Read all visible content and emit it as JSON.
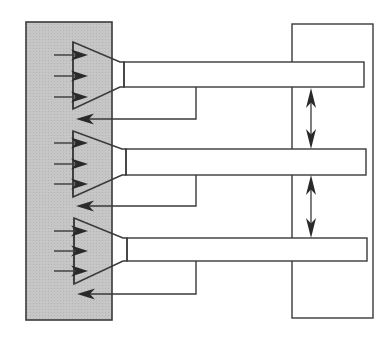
{
  "diagram": {
    "type": "schematic",
    "colors": {
      "stroke": "#3a3a3a",
      "arrow_fill": "#2a2a2a",
      "panel_fill": "#c4c4c4",
      "background": "#ffffff"
    },
    "left_panel": {
      "x": 26,
      "y": 22,
      "w": 86,
      "h": 298
    },
    "right_frame": {
      "x": 292,
      "y": 24,
      "w": 81,
      "h": 294
    },
    "units": [
      {
        "id": 1,
        "funnel": {
          "x_left": 73,
          "y_top": 42,
          "y_bottom": 109,
          "x_neck": 124,
          "neck_top": 62,
          "neck_bottom": 87
        },
        "bar": {
          "x": 124,
          "y": 62,
          "w": 240,
          "h": 25
        },
        "input_arrows_y": [
          55,
          76,
          97
        ],
        "return": {
          "x_drop": 196,
          "y_line": 119,
          "x_end": 76
        }
      },
      {
        "id": 2,
        "funnel": {
          "x_left": 73,
          "y_top": 131,
          "y_bottom": 197,
          "x_neck": 126,
          "neck_top": 149,
          "neck_bottom": 175
        },
        "bar": {
          "x": 126,
          "y": 149,
          "w": 240,
          "h": 26
        },
        "input_arrows_y": [
          143,
          164,
          184
        ],
        "return": {
          "x_drop": 196,
          "y_line": 206,
          "x_end": 76
        }
      },
      {
        "id": 3,
        "funnel": {
          "x_left": 74,
          "y_top": 218,
          "y_bottom": 284,
          "x_neck": 127,
          "neck_top": 238,
          "neck_bottom": 261
        },
        "bar": {
          "x": 127,
          "y": 238,
          "w": 240,
          "h": 23
        },
        "input_arrows_y": [
          231,
          251,
          271
        ],
        "return": {
          "x_drop": 196,
          "y_line": 294,
          "x_end": 77
        }
      }
    ],
    "spacing_arrows": [
      {
        "x": 311,
        "y_top": 88,
        "y_bottom": 149
      },
      {
        "x": 311,
        "y_top": 175,
        "y_bottom": 238
      }
    ]
  }
}
